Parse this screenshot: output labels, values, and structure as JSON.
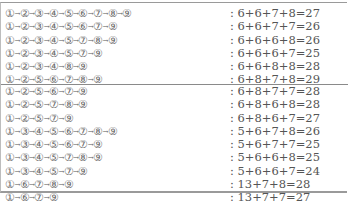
{
  "sections": [
    {
      "rows": [
        {
          "path": [
            "①",
            "②",
            "③",
            "④",
            "⑤",
            "⑥",
            "⑦",
            "⑧",
            "⑨"
          ],
          "sum": ": 6+6+7+8=27"
        },
        {
          "path": [
            "①",
            "②",
            "③",
            "④",
            "⑤",
            "⑥",
            "⑦",
            "⑨"
          ],
          "sum": ": 6+6+7+7=26"
        },
        {
          "path": [
            "①",
            "②",
            "③",
            "④",
            "⑤",
            "⑦",
            "⑧",
            "⑨"
          ],
          "sum": ": 6+6+6+8=26"
        },
        {
          "path": [
            "①",
            "②",
            "③",
            "④",
            "⑤",
            "⑦",
            "⑨"
          ],
          "sum": ": 6+6+6+7=25"
        },
        {
          "path": [
            "①",
            "②",
            "③",
            "④",
            "⑧",
            "⑨"
          ],
          "sum": ": 6+6+8+8=28"
        },
        {
          "path": [
            "①",
            "②",
            "⑤",
            "⑥",
            "⑦",
            "⑧",
            "⑨"
          ],
          "sum": ": 6+8+7+8=29"
        }
      ]
    },
    {
      "rows": [
        {
          "path": [
            "①",
            "②",
            "⑤",
            "⑥",
            "⑦",
            "⑨"
          ],
          "sum": ": 6+8+7+7=28"
        },
        {
          "path": [
            "①",
            "②",
            "⑤",
            "⑦",
            "⑧",
            "⑨"
          ],
          "sum": ": 6+8+6+8=28"
        },
        {
          "path": [
            "①",
            "②",
            "⑤",
            "⑦",
            "⑨"
          ],
          "sum": ": 6+8+6+7=27"
        },
        {
          "path": [
            "①",
            "③",
            "④",
            "⑤",
            "⑥",
            "⑦",
            "⑧",
            "⑨"
          ],
          "sum": ": 5+6+7+8=26"
        },
        {
          "path": [
            "①",
            "③",
            "④",
            "⑤",
            "⑥",
            "⑦",
            "⑨"
          ],
          "sum": ": 5+6+7+7=25"
        },
        {
          "path": [
            "①",
            "③",
            "④",
            "⑤",
            "⑦",
            "⑧",
            "⑨"
          ],
          "sum": ": 5+6+6+8=25"
        },
        {
          "path": [
            "①",
            "③",
            "④",
            "⑤",
            "⑦",
            "⑨"
          ],
          "sum": ": 5+6+6+7=24"
        },
        {
          "path": [
            "①",
            "⑥",
            "⑦",
            "⑧",
            "⑨"
          ],
          "sum": ": 13+7+8=28"
        },
        {
          "path": [
            "①",
            "⑥",
            "⑦",
            "⑨"
          ],
          "sum": ": 13+7+7=27"
        }
      ]
    }
  ],
  "arrow_glyph": "→"
}
